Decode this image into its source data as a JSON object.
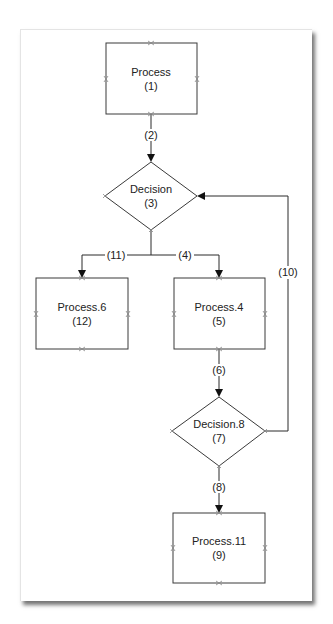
{
  "nodes": [
    {
      "id": "process-1",
      "type": "process",
      "name": "Process",
      "number": "(1)"
    },
    {
      "id": "decision-3",
      "type": "decision",
      "name": "Decision",
      "number": "(3)"
    },
    {
      "id": "process-6",
      "type": "process",
      "name": "Process.6",
      "number": "(12)"
    },
    {
      "id": "process-4",
      "type": "process",
      "name": "Process.4",
      "number": "(5)"
    },
    {
      "id": "decision-8",
      "type": "decision",
      "name": "Decision.8",
      "number": "(7)"
    },
    {
      "id": "process-11",
      "type": "process",
      "name": "Process.11",
      "number": "(9)"
    }
  ],
  "edges": [
    {
      "from": "process-1",
      "to": "decision-3",
      "label": "(2)"
    },
    {
      "from": "decision-3",
      "to": "process-6",
      "label": "(11)"
    },
    {
      "from": "decision-3",
      "to": "process-4",
      "label": "(4)"
    },
    {
      "from": "process-4",
      "to": "decision-8",
      "label": "(6)"
    },
    {
      "from": "decision-8",
      "to": "process-11",
      "label": "(8)"
    },
    {
      "from": "decision-8",
      "to": "decision-3",
      "label": "(10)"
    }
  ],
  "colors": {
    "stroke": "#3a3a3a",
    "arrow": "#111111",
    "port": "#888888",
    "background": "#ffffff"
  }
}
